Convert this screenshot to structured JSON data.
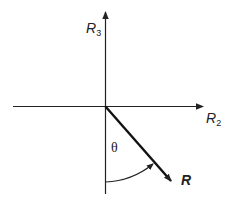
{
  "diagram": {
    "type": "vector-rotation-diagram",
    "axes": {
      "horizontal": {
        "label_base": "R",
        "label_sub": "2"
      },
      "vertical": {
        "label_base": "R",
        "label_sub": "3"
      }
    },
    "vector": {
      "label": "R"
    },
    "angle": {
      "label": "θ",
      "from": "negative vertical axis",
      "to": "vector R"
    },
    "colors": {
      "stroke": "#222222",
      "background": "#ffffff"
    }
  }
}
